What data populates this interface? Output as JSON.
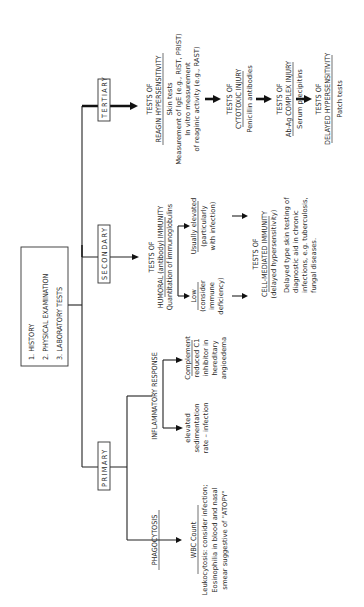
{
  "start_box": {
    "items": [
      "1.  HISTORY",
      "2.  PHYSICAL EXAMINATION",
      "3.  LABORATORY TESTS"
    ]
  },
  "levels": {
    "primary": "PRIMARY",
    "secondary": "SECONDARY",
    "tertiary": "TERTIARY"
  },
  "primary": {
    "phagocytosis": {
      "heading": "PHAGOCYTOSIS",
      "test": "WBC Count",
      "notes": [
        "Leukocytosis: consider infection;",
        "Eosinophilia in blood and nasal",
        "smear suggestive of \"ATOPY\""
      ]
    },
    "inflammatory": {
      "heading": "INFLAMMATORY RESPONSE",
      "left": [
        "elevated",
        "sedimentation",
        "rate – infection"
      ],
      "right_heading": "Complement",
      "right": [
        "reduced C1",
        "inhibitor in",
        "hereditary",
        "angioedema"
      ]
    }
  },
  "secondary": {
    "humoral": {
      "heading1": "TESTS OF",
      "heading2": "HUMORAL (antibody) IMMUNITY",
      "sub": "Quantitation of immunoglobulins",
      "low_heading": "Low",
      "low": [
        "(consider",
        "immune",
        "deficiency)"
      ],
      "high_heading": "Usually elevated",
      "high": [
        "(particularly",
        "with infection)"
      ]
    },
    "cell_mediated": {
      "heading1": "TESTS OF",
      "heading2": "CELL-MEDIATED IMMUNITY",
      "sub": "(delayed hypersensitivity)",
      "notes": [
        "Delayed type skin testing of",
        "diagnostic aid in chronic",
        "infections, e.g. tuberculosis,",
        "fungal diseases."
      ]
    }
  },
  "tertiary": {
    "reagin": {
      "heading1": "TESTS OF",
      "heading2": "REAGIN HYPERSENSITIVITY",
      "lines": [
        "Skin tests",
        "Measurement of IgE (e.g., RIST, PRIST)",
        "In vitro measurement",
        "of reaginic activity (e.g., RAST)"
      ]
    },
    "cytotoxic": {
      "heading1": "TESTS OF",
      "heading2": "CYTOTOXIC INJURY",
      "lines": [
        "Penicillin antibodies"
      ]
    },
    "complex": {
      "heading1": "TESTS OF",
      "heading2": "Ab-Ag COMPLEX INJURY",
      "lines": [
        "Serum precipitins"
      ]
    },
    "delayed": {
      "heading1": "TESTS OF",
      "heading2": "DELAYED HYPERSENSITIVITY",
      "lines": [
        "Patch tests"
      ]
    }
  }
}
